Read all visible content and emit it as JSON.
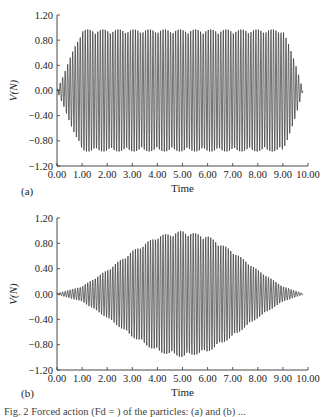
{
  "chart_data": [
    {
      "type": "line",
      "panel": "(a)",
      "title": "",
      "xlabel": "Time",
      "ylabel": "V(N)",
      "xlim": [
        0,
        10
      ],
      "ylim": [
        -1.2,
        1.2
      ],
      "xticks": [
        "0.00",
        "1.00",
        "2.00",
        "3.00",
        "4.00",
        "5.00",
        "6.00",
        "7.00",
        "8.00",
        "9.00",
        "10.00"
      ],
      "yticks": [
        "1.20",
        "0.80",
        "0.40",
        "0.00",
        "-0.40",
        "-0.80",
        "-1.20"
      ],
      "grid": false,
      "description": "Dense sinusoidal oscillation with envelope ramping from 0 at t=0 to ~0.97 at t≈1.0, flat ~0.97 until t≈9.0, then ramping down to 0 at t≈9.8",
      "envelope": {
        "t": [
          0.0,
          0.5,
          1.0,
          9.0,
          9.5,
          9.8
        ],
        "amplitude": [
          0.0,
          0.5,
          0.97,
          0.97,
          0.45,
          0.0
        ]
      },
      "cycles_approx": 100
    },
    {
      "type": "line",
      "panel": "(b)",
      "title": "",
      "xlabel": "Time",
      "ylabel": "V(N)",
      "xlim": [
        0,
        10
      ],
      "ylim": [
        -1.2,
        1.2
      ],
      "xticks": [
        "0.00",
        "1.00",
        "2.00",
        "3.00",
        "4.00",
        "5.00",
        "6.00",
        "7.00",
        "8.00",
        "9.00",
        "10.00"
      ],
      "yticks": [
        "1.20",
        "0.80",
        "0.40",
        "0.00",
        "-0.40",
        "-0.80",
        "-1.20"
      ],
      "grid": false,
      "description": "Dense sinusoidal oscillation with bell-shaped envelope starting near 0 at t=0, peaking ~1.0 at t≈5.0, returning to 0 at t≈9.8",
      "envelope": {
        "t": [
          0.0,
          1.0,
          2.0,
          3.0,
          4.0,
          5.0,
          6.0,
          7.0,
          8.0,
          9.0,
          9.8
        ],
        "amplitude": [
          0.01,
          0.12,
          0.38,
          0.68,
          0.92,
          1.0,
          0.92,
          0.68,
          0.38,
          0.12,
          0.01
        ]
      },
      "cycles_approx": 100
    }
  ],
  "labels": {
    "panel_a": "(a)",
    "panel_b": "(b)",
    "xlabel": "Time",
    "ylabel": "V(N)",
    "caption": "Fig. 2   Forced action (Fd = ) of the particles: (a) and (b) ..."
  }
}
